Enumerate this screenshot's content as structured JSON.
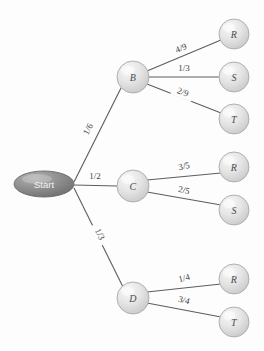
{
  "diagram": {
    "type": "probability-tree",
    "background_color": "#fdfdfd",
    "edge_color": "#5d5d5d",
    "node_fill_color": "#e3e3e3",
    "node_stroke_color": "#9a9a9a",
    "start_fill_color": "#8a8a8a",
    "start_text_color": "#f2f2f2",
    "label_text_color": "#4a4a4a"
  },
  "nodes": {
    "start": {
      "label": "Start",
      "shape": "ellipse",
      "cx": 44,
      "cy": 184,
      "rx": 30,
      "ry": 13
    },
    "b": {
      "label": "B",
      "shape": "circle",
      "cx": 133,
      "cy": 77,
      "r": 16
    },
    "c": {
      "label": "C",
      "shape": "circle",
      "cx": 133,
      "cy": 186,
      "r": 16
    },
    "d": {
      "label": "D",
      "shape": "circle",
      "cx": 133,
      "cy": 298,
      "r": 16
    },
    "b_r": {
      "label": "R",
      "shape": "circle",
      "cx": 234,
      "cy": 34,
      "r": 15
    },
    "b_s": {
      "label": "S",
      "shape": "circle",
      "cx": 234,
      "cy": 77,
      "r": 15
    },
    "b_t": {
      "label": "T",
      "shape": "circle",
      "cx": 234,
      "cy": 119,
      "r": 15
    },
    "c_r": {
      "label": "R",
      "shape": "circle",
      "cx": 234,
      "cy": 167,
      "r": 15
    },
    "c_s": {
      "label": "S",
      "shape": "circle",
      "cx": 234,
      "cy": 210,
      "r": 15
    },
    "d_r": {
      "label": "R",
      "shape": "circle",
      "cx": 234,
      "cy": 279,
      "r": 15
    },
    "d_t": {
      "label": "T",
      "shape": "circle",
      "cx": 234,
      "cy": 322,
      "r": 15
    }
  },
  "edges": [
    {
      "id": "start-b",
      "from": "Start",
      "to": "B",
      "probability": "1/6",
      "x1": 74,
      "y1": 182,
      "x2": 121,
      "y2": 88,
      "label_x": 88,
      "label_y": 129,
      "label_rotation": -63
    },
    {
      "id": "start-c",
      "from": "Start",
      "to": "C",
      "probability": "1/2",
      "x1": 74,
      "y1": 185,
      "x2": 117,
      "y2": 186,
      "label_x": 95,
      "label_y": 176,
      "label_rotation": 0
    },
    {
      "id": "start-d",
      "from": "Start",
      "to": "D",
      "probability": "1/3",
      "x1": 74,
      "y1": 188,
      "x2": 123,
      "y2": 287,
      "label_x": 100,
      "label_y": 234,
      "label_rotation": 64
    },
    {
      "id": "b-r",
      "from": "B",
      "to": "R",
      "probability": "4/9",
      "x1": 147,
      "y1": 71,
      "x2": 221,
      "y2": 40,
      "label_x": 181,
      "label_y": 48,
      "label_rotation": -22
    },
    {
      "id": "b-s",
      "from": "B",
      "to": "S",
      "probability": "1/3",
      "x1": 149,
      "y1": 77,
      "x2": 219,
      "y2": 77,
      "label_x": 184,
      "label_y": 68,
      "label_rotation": 0
    },
    {
      "id": "b-t",
      "from": "B",
      "to": "T",
      "probability": "2/9",
      "x1": 147,
      "y1": 84,
      "x2": 221,
      "y2": 113,
      "label_x": 183,
      "label_y": 92,
      "label_rotation": 21
    },
    {
      "id": "c-r",
      "from": "C",
      "to": "R",
      "probability": "3/5",
      "x1": 147,
      "y1": 180,
      "x2": 221,
      "y2": 173,
      "label_x": 184,
      "label_y": 166,
      "label_rotation": -12
    },
    {
      "id": "c-s",
      "from": "C",
      "to": "S",
      "probability": "2/5",
      "x1": 147,
      "y1": 192,
      "x2": 221,
      "y2": 205,
      "label_x": 184,
      "label_y": 190,
      "label_rotation": 12
    },
    {
      "id": "d-r",
      "from": "D",
      "to": "R",
      "probability": "1/4",
      "x1": 147,
      "y1": 292,
      "x2": 221,
      "y2": 284,
      "label_x": 184,
      "label_y": 278,
      "label_rotation": -14
    },
    {
      "id": "d-t",
      "from": "D",
      "to": "T",
      "probability": "3/4",
      "x1": 147,
      "y1": 303,
      "x2": 221,
      "y2": 317,
      "label_x": 184,
      "label_y": 300,
      "label_rotation": 14
    }
  ],
  "chart_data": {
    "type": "tree",
    "root": "Start",
    "levels": 2,
    "level1": {
      "outcomes": [
        "B",
        "C",
        "D"
      ],
      "probabilities": [
        "1/6",
        "1/2",
        "1/3"
      ],
      "values": [
        0.16667,
        0.5,
        0.33333
      ]
    },
    "level2": [
      {
        "parent": "B",
        "outcomes": [
          "R",
          "S",
          "T"
        ],
        "probabilities": [
          "4/9",
          "1/3",
          "2/9"
        ],
        "values": [
          0.44444,
          0.33333,
          0.22222
        ]
      },
      {
        "parent": "C",
        "outcomes": [
          "R",
          "S"
        ],
        "probabilities": [
          "3/5",
          "2/5"
        ],
        "values": [
          0.6,
          0.4
        ]
      },
      {
        "parent": "D",
        "outcomes": [
          "R",
          "T"
        ],
        "probabilities": [
          "1/4",
          "3/4"
        ],
        "values": [
          0.25,
          0.75
        ]
      }
    ],
    "paths": [
      {
        "path": "Start-B-R",
        "probabilities": [
          "1/6",
          "4/9"
        ]
      },
      {
        "path": "Start-B-S",
        "probabilities": [
          "1/6",
          "1/3"
        ]
      },
      {
        "path": "Start-B-T",
        "probabilities": [
          "1/6",
          "2/9"
        ]
      },
      {
        "path": "Start-C-R",
        "probabilities": [
          "1/2",
          "3/5"
        ]
      },
      {
        "path": "Start-C-S",
        "probabilities": [
          "1/2",
          "2/5"
        ]
      },
      {
        "path": "Start-D-R",
        "probabilities": [
          "1/3",
          "1/4"
        ]
      },
      {
        "path": "Start-D-T",
        "probabilities": [
          "1/3",
          "3/4"
        ]
      }
    ]
  }
}
